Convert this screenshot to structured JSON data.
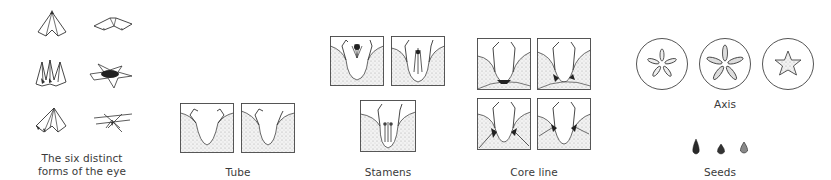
{
  "figure": {
    "panels": [
      {
        "id": "eye",
        "label_line1": "The six distinct",
        "label_line2": "forms of the eye",
        "count": 6
      },
      {
        "id": "tube",
        "label": "Tube",
        "count": 2
      },
      {
        "id": "stamens",
        "label": "Stamens",
        "count": 3
      },
      {
        "id": "core-line",
        "label": "Core line",
        "count": 4
      },
      {
        "id": "axis",
        "label": "Axis",
        "count": 3
      },
      {
        "id": "seeds",
        "label": "Seeds",
        "count": 3
      }
    ]
  },
  "colors": {
    "ink": "#333333",
    "stipple": "#bdbdbd",
    "background": "#ffffff"
  }
}
